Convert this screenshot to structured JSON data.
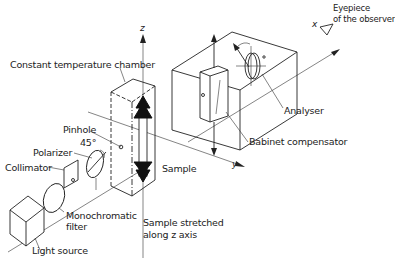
{
  "labels": {
    "constant_temperature_chamber": "Constant temperature chamber",
    "pinhole": "Pinhole",
    "angle_45": "45°",
    "polarizer": "Polarizer",
    "collimator": "Collimator",
    "monochromatic_filter_line1": "Monochromatic",
    "monochromatic_filter_line2": "filter",
    "light_source": "Light source",
    "sample": "Sample",
    "sample_stretched_line1": "Sample stretched",
    "sample_stretched_line2": "along z axis",
    "analyser": "Analyser",
    "babinet_compensator": "Babinet compensator",
    "eyepiece_line1": "Eyepiece",
    "eyepiece_line2": "of the observer"
  },
  "axes": {
    "x": "x",
    "y": "y",
    "z": "z"
  },
  "colors": {
    "line": "#222222",
    "background": "#ffffff"
  }
}
